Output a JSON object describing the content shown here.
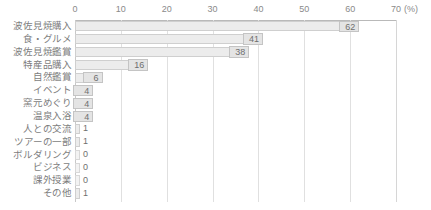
{
  "chart_data": {
    "type": "bar",
    "orientation": "horizontal",
    "title": "",
    "xlabel": "(%)",
    "ylabel": "",
    "xlim": [
      0,
      70
    ],
    "xticks": [
      0,
      10,
      20,
      30,
      40,
      50,
      60,
      70
    ],
    "xtick_labels": [
      "0",
      "10",
      "20",
      "30",
      "40",
      "50",
      "60",
      "70"
    ],
    "unit_suffix": "(%)",
    "grid": true,
    "legend": false,
    "categories": [
      "波佐見焼購入",
      "食・グルメ",
      "波佐見焼鑑賞",
      "特産品購入",
      "自然鑑賞",
      "イベント",
      "窯元めぐり",
      "温泉入浴",
      "人との交流",
      "ツアーの一部",
      "ボルダリング",
      "ビジネス",
      "課外授業",
      "その他"
    ],
    "values": [
      62,
      41,
      38,
      16,
      6,
      4,
      4,
      4,
      1,
      1,
      0,
      0,
      0,
      1
    ],
    "value_labels": [
      "62",
      "41",
      "38",
      "16",
      "6",
      "4",
      "4",
      "4",
      "1",
      "1",
      "0",
      "0",
      "0",
      "1"
    ],
    "colors": {
      "bar_fill": "#ececec",
      "bar_border": "#cfcfcf",
      "grid": "#e0e0e0",
      "axis": "#b9b9b9",
      "text": "#7d7d7d"
    }
  }
}
